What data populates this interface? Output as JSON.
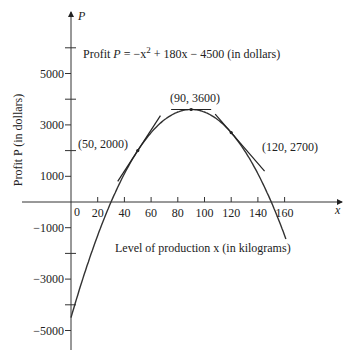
{
  "chart_data": {
    "type": "line",
    "title_parts": {
      "prefix": "Profit ",
      "var": "P",
      "eq": " = −x",
      "sup": "2",
      "rest": " + 180x − 4500 (in dollars)"
    },
    "xlabel": "Level of production x (in kilograms)",
    "ylabel": "Profit P (in dollars)",
    "x_axis_letter": "x",
    "y_axis_letter": "P",
    "origin_label": "0",
    "xlim": [
      0,
      170
    ],
    "ylim": [
      -5800,
      7000
    ],
    "x_ticks": [
      20,
      40,
      60,
      80,
      100,
      120,
      140,
      160
    ],
    "x_tick_labels": [
      "20",
      "40",
      "60",
      "80",
      "100",
      "120",
      "140",
      "160"
    ],
    "y_ticks_labeled": [
      5000,
      3000,
      1000,
      -1000,
      -3000,
      -5000
    ],
    "y_tick_labels": [
      "5000",
      "3000",
      "1000",
      "−1000",
      "−3000",
      "−5000"
    ],
    "y_ticks_minor": [
      6000,
      4000,
      2000,
      -2000,
      -4000
    ],
    "series": [
      {
        "name": "Profit curve",
        "function": "-x^2 + 180x - 4500",
        "x": [
          0,
          10,
          20,
          30,
          40,
          50,
          60,
          70,
          80,
          90,
          100,
          110,
          120,
          130,
          140,
          150,
          160
        ],
        "y": [
          -4500,
          -2800,
          -1300,
          0,
          1100,
          2000,
          2700,
          3200,
          3500,
          3600,
          3500,
          3200,
          2700,
          2000,
          1100,
          0,
          -1300
        ]
      }
    ],
    "tangent_lines": [
      {
        "point": [
          50,
          2000
        ],
        "slope": 80,
        "label": "(50, 2000)"
      },
      {
        "point": [
          90,
          3600
        ],
        "slope": 0,
        "label": "(90, 3600)"
      },
      {
        "point": [
          120,
          2700
        ],
        "slope": -60,
        "label": "(120, 2700)"
      }
    ],
    "grid": false,
    "legend": "none"
  }
}
